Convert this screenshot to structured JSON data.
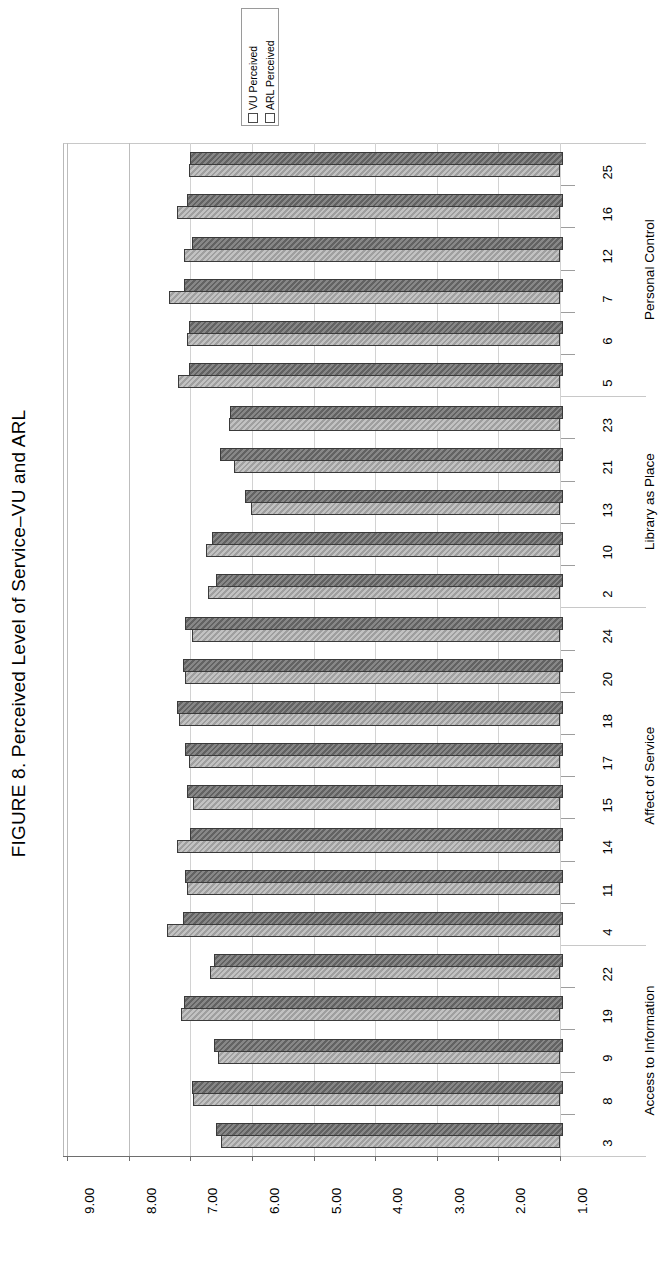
{
  "figure": {
    "title": "FIGURE 8. Perceived Level of Service–VU and ARL"
  },
  "legend": {
    "position": "top-center",
    "entries": [
      {
        "label": "VU Perceived",
        "color": "#a8a8a8",
        "icon": "legend-swatch"
      },
      {
        "label": "ARL Perceived",
        "color": "#6d6d6d",
        "icon": "legend-swatch"
      }
    ]
  },
  "axes": {
    "value_axis_ticks": [
      "9.00",
      "8.00",
      "7.00",
      "6.00",
      "5.00",
      "4.00",
      "3.00",
      "2.00",
      "1.00"
    ],
    "value_axis_min": 1.0,
    "value_axis_max": 9.0,
    "value_axis_orientation": "horizontal-reversed",
    "grid": true
  },
  "groups": [
    {
      "name": "Personal Control",
      "items": [
        "25",
        "16",
        "12",
        "7",
        "6",
        "5"
      ]
    },
    {
      "name": "Library as Place",
      "items": [
        "23",
        "21",
        "13",
        "10",
        "2"
      ]
    },
    {
      "name": "Affect of Service",
      "items": [
        "24",
        "20",
        "18",
        "17",
        "15",
        "14",
        "11",
        "4"
      ]
    },
    {
      "name": "Access to Information",
      "items": [
        "22",
        "19",
        "9",
        "8",
        "3"
      ]
    }
  ],
  "chart_data": {
    "type": "bar",
    "orientation": "horizontal",
    "title": "FIGURE 8. Perceived Level of Service–VU and ARL",
    "xlabel": "",
    "ylabel": "",
    "xlim": [
      1.0,
      9.0
    ],
    "grid": true,
    "legend_position": "top-center",
    "categories": [
      "25",
      "16",
      "12",
      "7",
      "6",
      "5",
      "23",
      "21",
      "13",
      "10",
      "2",
      "24",
      "20",
      "18",
      "17",
      "15",
      "14",
      "11",
      "4",
      "22",
      "19",
      "9",
      "8",
      "3"
    ],
    "category_groups": [
      {
        "name": "Personal Control",
        "categories": [
          "25",
          "16",
          "12",
          "7",
          "6",
          "5"
        ]
      },
      {
        "name": "Library as Place",
        "categories": [
          "23",
          "21",
          "13",
          "10",
          "2"
        ]
      },
      {
        "name": "Affect of Service",
        "categories": [
          "24",
          "20",
          "18",
          "17",
          "15",
          "14",
          "11",
          "4"
        ]
      },
      {
        "name": "Access to Information",
        "categories": [
          "22",
          "19",
          "9",
          "8",
          "3"
        ]
      }
    ],
    "series": [
      {
        "name": "VU Perceived",
        "color": "#a8a8a8",
        "values": [
          7.03,
          7.22,
          7.1,
          7.35,
          7.05,
          7.2,
          6.38,
          6.3,
          6.02,
          6.75,
          6.72,
          6.98,
          7.08,
          7.18,
          7.02,
          6.95,
          7.22,
          7.05,
          7.38,
          6.68,
          7.15,
          6.55,
          6.95,
          6.5
        ]
      },
      {
        "name": "ARL Perceived",
        "color": "#6d6d6d",
        "values": [
          7.0,
          7.05,
          6.98,
          7.1,
          7.02,
          7.02,
          6.35,
          6.52,
          6.12,
          6.65,
          6.58,
          7.08,
          7.12,
          7.22,
          7.08,
          7.05,
          7.0,
          7.08,
          7.12,
          6.62,
          7.1,
          6.62,
          6.98,
          6.58
        ]
      }
    ]
  }
}
